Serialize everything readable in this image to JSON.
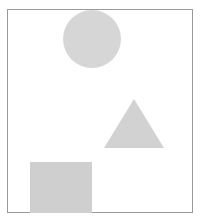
{
  "image": {
    "title": "Geometric shapes on white background",
    "width": 201,
    "height": 223,
    "background_color": "#ffffff",
    "description": "Three light-gray geometric shapes arranged inside a thin rectangular border: a circle at top center, a triangle at middle right, and a square at bottom left."
  },
  "frame": {
    "name": "image-border",
    "stroke_color": "#9a9a9a",
    "stroke_width": 1,
    "x": 7,
    "y": 9,
    "width": 186,
    "height": 204
  },
  "shapes": [
    {
      "id": "circle",
      "label": "Circle",
      "type": "circle",
      "fill_color": "#d6d6d6",
      "center_x": 92,
      "center_y": 39,
      "radius": 29,
      "bbox": {
        "x": 63,
        "y": 10,
        "width": 58,
        "height": 58
      },
      "position": "top-center"
    },
    {
      "id": "triangle",
      "label": "Triangle",
      "type": "triangle",
      "fill_color": "#d2d2d2",
      "apex_x": 134,
      "apex_y": 99,
      "base_left_x": 104,
      "base_right_x": 164,
      "base_y": 148,
      "bbox": {
        "x": 104,
        "y": 99,
        "width": 60,
        "height": 49
      },
      "position": "middle-right"
    },
    {
      "id": "square",
      "label": "Square",
      "type": "square",
      "fill_color": "#cfcfcf",
      "bbox": {
        "x": 30,
        "y": 162,
        "width": 62,
        "height": 51
      },
      "position": "bottom-left",
      "clipped": "bottom edge meets the frame border"
    }
  ]
}
